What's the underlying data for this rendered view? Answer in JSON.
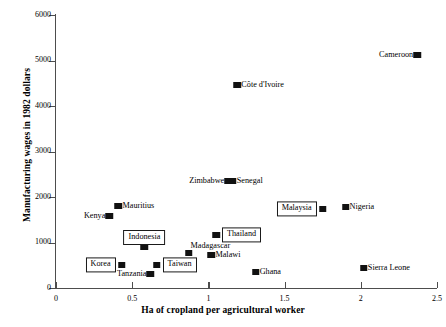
{
  "chart_data": {
    "type": "scatter",
    "title": "",
    "xlabel": "Ha of cropland per agricultural worker",
    "ylabel": "Manufacturing wages in 1982 dollars",
    "xlim": [
      0,
      2.5
    ],
    "ylim": [
      0,
      6000
    ],
    "xticks": [
      "0",
      "0.5",
      "1",
      "1.5",
      "2",
      "2.5"
    ],
    "xtick_values": [
      0,
      0.5,
      1,
      1.5,
      2,
      2.5
    ],
    "yticks": [
      "0",
      "1000",
      "2000",
      "3000",
      "4000",
      "5000",
      "6000"
    ],
    "ytick_values": [
      0,
      1000,
      2000,
      3000,
      4000,
      5000,
      6000
    ],
    "grid": false,
    "legend": "none",
    "points": [
      {
        "label": "Cameroon",
        "x": 2.37,
        "y": 5120,
        "label_pos": "left",
        "boxed": false
      },
      {
        "label": "Côte d'Ivoire",
        "x": 1.19,
        "y": 4460,
        "label_pos": "right",
        "boxed": false
      },
      {
        "label": "Zimbabwe",
        "x": 1.13,
        "y": 2350,
        "label_pos": "left",
        "boxed": false
      },
      {
        "label": "Senegal",
        "x": 1.16,
        "y": 2360,
        "label_pos": "right",
        "boxed": false
      },
      {
        "label": "Nigeria",
        "x": 1.9,
        "y": 1780,
        "label_pos": "right",
        "boxed": false
      },
      {
        "label": "Malaysia",
        "x": 1.75,
        "y": 1735,
        "label_pos": "left",
        "boxed": true
      },
      {
        "label": "Mauritius",
        "x": 0.41,
        "y": 1800,
        "label_pos": "right",
        "boxed": false
      },
      {
        "label": "Kenya",
        "x": 0.35,
        "y": 1580,
        "label_pos": "left",
        "boxed": false
      },
      {
        "label": "Thailand",
        "x": 1.05,
        "y": 1165,
        "label_pos": "right",
        "boxed": true
      },
      {
        "label": "Indonesia",
        "x": 0.58,
        "y": 900,
        "label_pos": "above",
        "boxed": true
      },
      {
        "label": "Madagascar",
        "x": 0.87,
        "y": 770,
        "label_pos": "above-right",
        "boxed": false
      },
      {
        "label": "Malawi",
        "x": 1.02,
        "y": 725,
        "label_pos": "right",
        "boxed": false
      },
      {
        "label": "Korea",
        "x": 0.43,
        "y": 505,
        "label_pos": "left",
        "boxed": true
      },
      {
        "label": "Taiwan",
        "x": 0.66,
        "y": 505,
        "label_pos": "right",
        "boxed": true
      },
      {
        "label": "Tanzania",
        "x": 0.62,
        "y": 310,
        "label_pos": "left",
        "boxed": false
      },
      {
        "label": "Ghana",
        "x": 1.31,
        "y": 350,
        "label_pos": "right",
        "boxed": false
      },
      {
        "label": "Sierra Leone",
        "x": 2.02,
        "y": 440,
        "label_pos": "right",
        "boxed": false
      }
    ]
  },
  "colors": {
    "marker": "#111111",
    "axis": "#4d4d4d",
    "background": "#ffffff",
    "text": "#000000"
  }
}
